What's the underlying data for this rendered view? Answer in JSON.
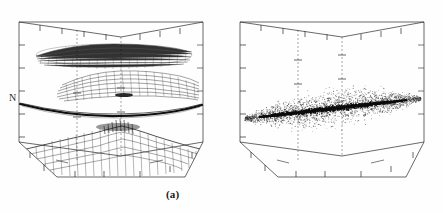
{
  "figure": {
    "kind": "scientific-figure",
    "background_color": "#fefefe",
    "ink_color": "#1c1c1c",
    "panels": [
      {
        "id": "a",
        "caption": "(a)",
        "y_axis_label": "N",
        "description": "3D wireframe box containing four vertically stratified structures"
      },
      {
        "id": "b",
        "caption": "(b)",
        "y_axis_label": "N",
        "x_axis_label": "x",
        "description": "3D wireframe box containing a single diffuse scatter cloud with dense dark mid-plane"
      }
    ]
  },
  "chart_data": {
    "type": "scatter",
    "title": "",
    "subtitle": "",
    "xlabel": "",
    "ylabel": "N",
    "zlabel": "",
    "grid": false,
    "legend_position": "none",
    "projection": "3d-box-wireframe",
    "xlim": [
      0,
      1
    ],
    "ylim": [
      0,
      1
    ],
    "zlim": [
      0,
      1
    ],
    "x_ticks": [
      0,
      0.2,
      0.4,
      0.6,
      0.8,
      1.0
    ],
    "y_ticks": [
      0,
      0.2,
      0.4,
      0.6,
      0.8,
      1.0
    ],
    "z_ticks": [
      0,
      0.2,
      0.4,
      0.6,
      0.8,
      1.0
    ],
    "x_ticklabels": [
      "",
      "",
      "",
      "",
      "",
      ""
    ],
    "y_ticklabels": [
      "",
      "",
      "",
      "",
      "",
      ""
    ],
    "z_ticklabels": [
      "",
      "",
      "",
      "",
      "",
      ""
    ],
    "panels": [
      {
        "name": "(a)",
        "series": [
          {
            "name": "upper lens cloud",
            "style": "mesh-stipple",
            "shape": "elongated-lens",
            "center_height": 0.8,
            "thickness": 0.1,
            "extent_x": 0.72,
            "density": "medium"
          },
          {
            "name": "warped mesh sheet",
            "style": "mesh-hatch",
            "shape": "wavy-sheet",
            "center_height": 0.6,
            "thickness": 0.07,
            "extent_x": 0.8,
            "density": "medium-high"
          },
          {
            "name": "thin dark sheet",
            "style": "solid-curve",
            "shape": "shallow-saddle",
            "center_height": 0.44,
            "thickness": 0.012,
            "extent_x": 0.98,
            "density": "very-high"
          },
          {
            "name": "rough terrain surface",
            "style": "spike-mesh",
            "shape": "peaked-terrain",
            "center_height": 0.16,
            "thickness": 0.18,
            "extent_x": 0.95,
            "density": "high"
          }
        ]
      },
      {
        "name": "(b)",
        "series": [
          {
            "name": "diffuse halo",
            "style": "scatter-points",
            "shape": "flattened-cloud",
            "center_height": 0.45,
            "thickness": 0.4,
            "extent_x": 0.95,
            "density": "sparse"
          },
          {
            "name": "dense mid-plane",
            "style": "scatter-points",
            "shape": "tilted-slab",
            "center_height": 0.43,
            "thickness": 0.08,
            "extent_x": 0.8,
            "density": "very-high"
          }
        ]
      }
    ]
  }
}
